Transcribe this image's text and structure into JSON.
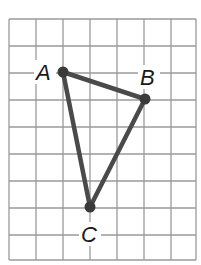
{
  "figure": {
    "type": "triangle-on-grid",
    "grid": {
      "columns": 7,
      "rows": 9,
      "line_color": "#9a9a9a"
    },
    "colors": {
      "segment": "#4a4a4a",
      "point": "#3a3a3a",
      "label": "#1a1a1a",
      "background": "#ffffff"
    },
    "points": [
      {
        "label": "A",
        "grid_x": 2,
        "grid_y": 2
      },
      {
        "label": "B",
        "grid_x": 5,
        "grid_y": 3
      },
      {
        "label": "C",
        "grid_x": 3,
        "grid_y": 7
      }
    ],
    "segments": [
      {
        "from": "A",
        "to": "B"
      },
      {
        "from": "B",
        "to": "C"
      },
      {
        "from": "C",
        "to": "A"
      }
    ],
    "labels": {
      "A": "A",
      "B": "B",
      "C": "C"
    }
  }
}
